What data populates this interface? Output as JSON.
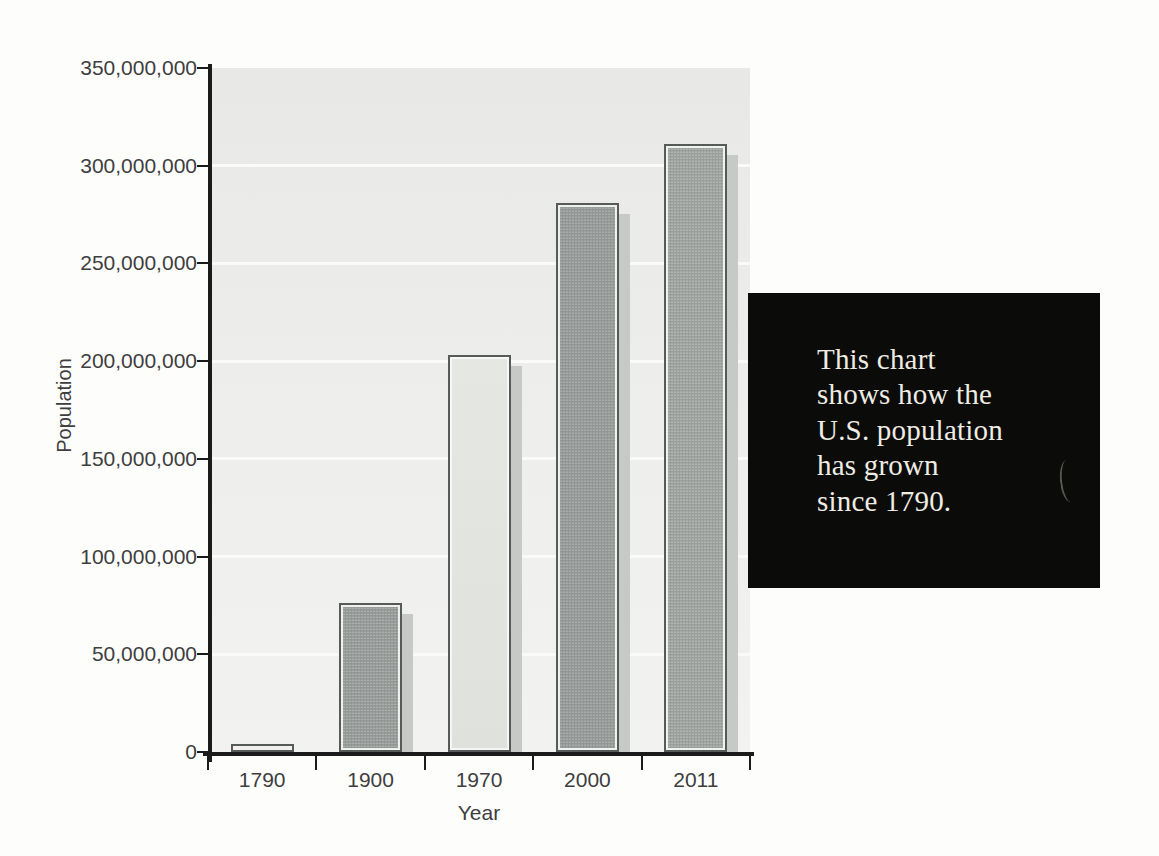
{
  "chart_data": {
    "type": "bar",
    "title": "",
    "categories": [
      "1790",
      "1900",
      "1970",
      "2000",
      "2011"
    ],
    "values": [
      4000000,
      76000000,
      203000000,
      281000000,
      311000000
    ],
    "xlabel": "Year",
    "ylabel": "Population",
    "ylim": [
      0,
      350000000
    ],
    "ytick_step": 50000000,
    "ytick_labels": [
      "0",
      "50,000,000",
      "100,000,000",
      "150,000,000",
      "200,000,000",
      "250,000,000",
      "300,000,000",
      "350,000,000"
    ],
    "grid": true,
    "legend": false,
    "bar_width_px": 63
  },
  "callout": {
    "lines": [
      "This chart",
      "shows how the",
      "U.S. population",
      "has grown",
      "since 1790."
    ],
    "text": "This chart shows how the U.S. population has grown since 1790.",
    "background": "#0b0b0a",
    "text_color": "#eeece3"
  },
  "style": {
    "page_background": "#fdfdfc",
    "plot_background_top": "#e8e9e7",
    "plot_background_bottom": "#f2f2f0",
    "gridline_color": "#fafaf8",
    "axis_color": "#1b1b1b",
    "tick_label_color": "#3e3e3e",
    "bar_border_color": "#565a58",
    "bar_inner_edge_color": "#f0f1ef",
    "bar_shadow_color": "#c7c9c6",
    "bar_fills": [
      {
        "top": "#b6b8b5",
        "bottom": "#acaeab"
      },
      {
        "top": "#aeb2b0",
        "bottom": "#999d9c"
      },
      {
        "top": "#e5e7e3",
        "bottom": "#dfe1dd"
      },
      {
        "top": "#a9adab",
        "bottom": "#9ca09f"
      },
      {
        "top": "#b3b6b3",
        "bottom": "#a5a9a6"
      }
    ]
  }
}
